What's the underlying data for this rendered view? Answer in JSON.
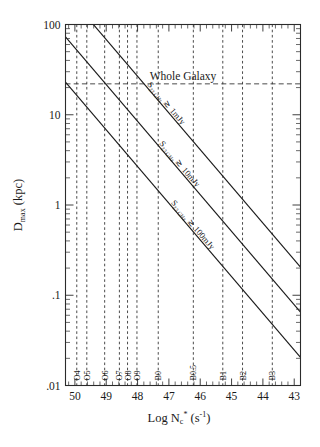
{
  "chart_data": {
    "type": "line",
    "title": "",
    "xlabel": "Log N*c (s-1)",
    "ylabel": "Dmax (kpc)",
    "xlabel_parts": {
      "log": "Log",
      "n": "N",
      "sub": "c",
      "star": "*",
      "paren_open": "(s",
      "sup": "-1",
      "paren_close": ")"
    },
    "ylabel_parts": {
      "d": "D",
      "sub": "max",
      "unit": "(kpc)"
    },
    "x_scale": "linear-reversed",
    "y_scale": "log",
    "xlim": [
      50.3,
      42.8
    ],
    "ylim": [
      0.01,
      100
    ],
    "grid": false,
    "legend": "inline-rotated-labels",
    "xticks": [
      50,
      49,
      48,
      47,
      46,
      45,
      44,
      43
    ],
    "xtick_labels": [
      "50",
      "49",
      "48",
      "47",
      "46",
      "45",
      "44",
      "43"
    ],
    "yticks": [
      100,
      10,
      1,
      0.1,
      0.01
    ],
    "ytick_labels": [
      "100",
      "10",
      "1",
      ".1",
      ".01"
    ],
    "series": [
      {
        "name": "S23 GHz >~ 1mJy",
        "label": "S23 GHz ≳ 1mJy",
        "points": [
          [
            50.3,
            230
          ],
          [
            42.8,
            0.205
          ]
        ]
      },
      {
        "name": "S23 GHz >~ 10mJy",
        "label": "S23 GHz ≳ 10mJy",
        "points": [
          [
            50.3,
            73
          ],
          [
            42.8,
            0.065
          ]
        ]
      },
      {
        "name": "S23 GHz >~ 100mJy",
        "label": "S23 GHz ≳ 100mJy",
        "points": [
          [
            50.3,
            23
          ],
          [
            42.8,
            0.0205
          ]
        ]
      }
    ],
    "series_label_parts": [
      {
        "s": "S",
        "sub": "23 GHz",
        "rel": "≳",
        "val": "1mJy"
      },
      {
        "s": "S",
        "sub": "23 GHz",
        "rel": "≳",
        "val": "10mJy"
      },
      {
        "s": "S",
        "sub": "23 GHz",
        "rel": "≳",
        "val": "100mJy"
      }
    ],
    "annotations": [
      {
        "name": "whole-galaxy",
        "text": "Whole Galaxy",
        "type": "hline",
        "y_value": 22
      }
    ],
    "spectral_types": [
      {
        "label": "O4",
        "x": 49.94
      },
      {
        "label": "O5",
        "x": 49.62
      },
      {
        "label": "O6",
        "x": 49.05
      },
      {
        "label": "O7",
        "x": 48.58
      },
      {
        "label": "O8",
        "x": 48.32
      },
      {
        "label": "O9",
        "x": 48.02
      },
      {
        "label": "B0",
        "x": 47.34
      },
      {
        "label": "B0.5",
        "x": 46.22
      },
      {
        "label": "B1",
        "x": 45.28
      },
      {
        "label": "B2",
        "x": 44.65
      },
      {
        "label": "B3",
        "x": 43.7
      }
    ]
  }
}
